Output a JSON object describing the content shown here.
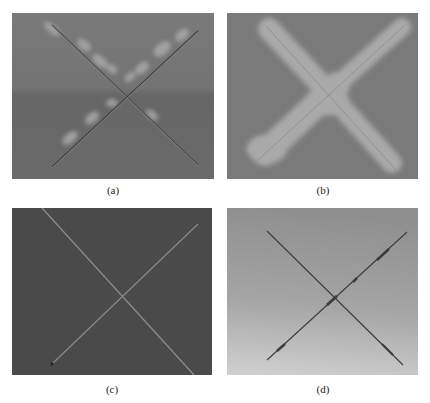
{
  "figure": {
    "panels": [
      {
        "id": "a",
        "caption": "(a)",
        "description": "Gray surface with X-shaped scratch and light blister spots along arms",
        "background": "#707070"
      },
      {
        "id": "b",
        "caption": "(b)",
        "description": "Gray surface with wide light corroded X-shaped region",
        "background": "#787878",
        "mark_color": "#a8a8a8"
      },
      {
        "id": "c",
        "caption": "(c)",
        "description": "Dark surface with thin light X-shaped scratch",
        "background": "#4a4a4a",
        "mark_color": "#8a8a8a"
      },
      {
        "id": "d",
        "caption": "(d)",
        "description": "Light gradient surface with thin dark X-shaped scratch",
        "background": "#a0a0a0",
        "mark_color": "#3a3a3a"
      }
    ]
  }
}
